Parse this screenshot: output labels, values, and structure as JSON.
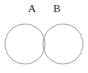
{
  "figure": {
    "type": "venn-diagram",
    "background_color": "#ffffff",
    "stroke_color": "#9a9a9a",
    "stroke_width": 0.9,
    "label_color": "#2b2b2b",
    "width": 88,
    "height": 73
  },
  "sets": [
    {
      "label": "A",
      "circle": {
        "cx": 25,
        "cy": 44,
        "r": 20
      },
      "label_position": {
        "x": 32,
        "y": 9
      }
    },
    {
      "label": "B",
      "circle": {
        "cx": 63,
        "cy": 44,
        "r": 20
      },
      "label_position": {
        "x": 57,
        "y": 9
      }
    }
  ],
  "intersection": {
    "top_vertex": {
      "x": 44,
      "y": 19
    },
    "bottom_vertex": {
      "x": 44,
      "y": 65
    },
    "fill": "none"
  }
}
